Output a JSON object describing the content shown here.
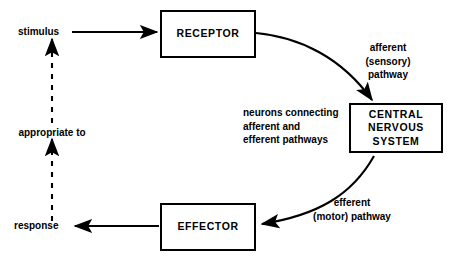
{
  "diagram": {
    "background_color": "#ffffff",
    "stroke_color": "#000000",
    "nodes": {
      "receptor": {
        "label": "RECEPTOR"
      },
      "cns": {
        "label": "CENTRAL\nNERVOUS\nSYSTEM"
      },
      "effector": {
        "label": "EFFECTOR"
      }
    },
    "labels": {
      "stimulus": "stimulus",
      "response": "response",
      "appropriate_to": "appropriate to",
      "afferent_pathway": "afferent (sensory)\npathway",
      "neurons_connecting": "neurons connecting\nafferent and\nefferent pathways",
      "efferent_pathway": "efferent\n(motor) pathway"
    },
    "connections": [
      {
        "name": "stimulus-to-receptor",
        "kind": "solid-arrow",
        "from": "stimulus",
        "to": "receptor"
      },
      {
        "name": "receptor-to-cns",
        "kind": "curved-arrow",
        "from": "receptor",
        "to": "cns"
      },
      {
        "name": "cns-to-effector",
        "kind": "curved-arrow",
        "from": "cns",
        "to": "effector"
      },
      {
        "name": "effector-to-response",
        "kind": "solid-arrow",
        "from": "effector",
        "to": "response"
      },
      {
        "name": "response-to-stimulus",
        "kind": "dashed-arrow",
        "from": "response",
        "to": "stimulus"
      }
    ]
  }
}
